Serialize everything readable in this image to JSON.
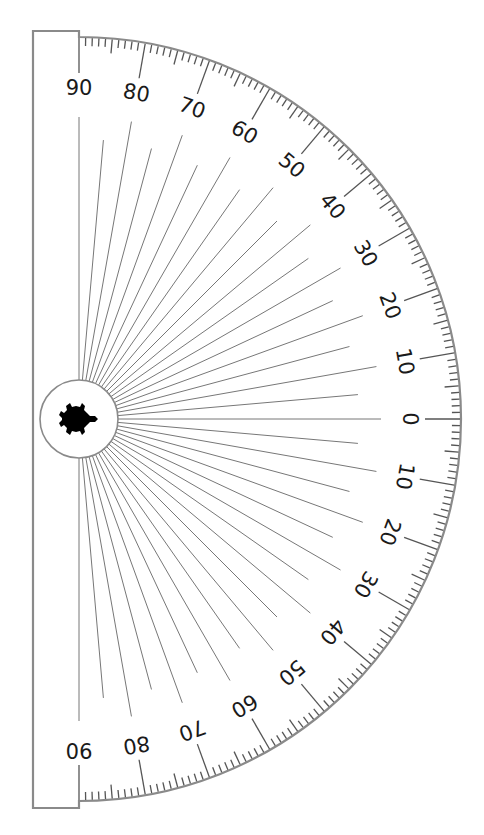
{
  "diagram": {
    "type": "protractor",
    "orientation": "rotated 90 degrees clockwise, straight edge on left",
    "center_icon": "turtle-icon",
    "labels_top_half": [
      "90",
      "80",
      "70",
      "60",
      "50",
      "40",
      "30",
      "20",
      "10",
      "0"
    ],
    "labels_bottom_half": [
      "10",
      "20",
      "30",
      "40",
      "50",
      "60",
      "70",
      "80",
      "90"
    ],
    "label_step_degrees": 10,
    "radial_line_step_degrees": 5,
    "minor_tick_step_degrees": 1,
    "colors": {
      "outline": "#8a8a8a",
      "ticks": "#555555",
      "radial_lines": "#777777",
      "labels": "#1a1a1a",
      "turtle": "#000000",
      "background": "#ffffff"
    },
    "geometry": {
      "center_x": 79,
      "center_y": 419,
      "arc_radius": 382,
      "hub_radius": 39,
      "label_radius": 331,
      "radial_line_outer": 310,
      "left_edge_x": 33,
      "top_y": 31,
      "bottom_y": 808
    }
  }
}
